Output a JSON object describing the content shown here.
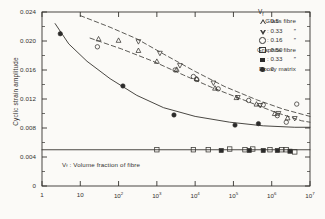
{
  "chart_data": {
    "type": "scatter",
    "title": "",
    "xlabel": "",
    "ylabel": "Cyclic strain amplitude",
    "xscale": "log",
    "xlim": [
      1,
      10000000
    ],
    "ylim": [
      0,
      0.024
    ],
    "grid": false,
    "xticklabels": [
      "1",
      "10",
      "10²",
      "10³",
      "10⁴",
      "10⁵",
      "10⁶",
      "10⁷"
    ],
    "xtickvalues": [
      1,
      10,
      100,
      1000,
      10000,
      100000,
      1000000,
      10000000
    ],
    "yticklabels": [
      "0",
      "0.004",
      "0.008",
      "0.012",
      "0.016",
      "0.020",
      "0.024"
    ],
    "ytickvalues": [
      0,
      0.004,
      0.008,
      0.012,
      0.016,
      0.02,
      0.024
    ],
    "annotation": "Vf : Volume fraction of fibre",
    "legend_position": "top-right",
    "legend_header": "Vf",
    "series": [
      {
        "name": "Glass fibre",
        "vf": "0.5",
        "marker": "triangle-up-open",
        "points": [
          [
            30,
            0.0203
          ],
          [
            100,
            0.0201
          ],
          [
            330,
            0.0187
          ],
          [
            1000,
            0.0172
          ],
          [
            3300,
            0.0161
          ],
          [
            11000,
            0.0148
          ],
          [
            33000,
            0.0135
          ],
          [
            120000,
            0.0122
          ],
          [
            400000,
            0.0113
          ],
          [
            1200000,
            0.01
          ],
          [
            2600000,
            0.0094
          ]
        ]
      },
      {
        "name": "Glass fibre",
        "vf": "0.33",
        "marker": "triangle-down-open",
        "points": [
          [
            330,
            0.0199
          ],
          [
            1200,
            0.0183
          ],
          [
            4000,
            0.0166
          ],
          [
            30000,
            0.0142
          ],
          [
            130000,
            0.0122
          ],
          [
            500000,
            0.0111
          ],
          [
            1500000,
            0.01
          ],
          [
            4000000,
            0.0093
          ]
        ]
      },
      {
        "name": "Glass fibre",
        "vf": "0.16",
        "marker": "circle-open",
        "points": [
          [
            28,
            0.0192
          ],
          [
            3000,
            0.016
          ],
          [
            9000,
            0.0151
          ],
          [
            11000,
            0.0147
          ],
          [
            40000,
            0.0134
          ],
          [
            250000,
            0.0118
          ],
          [
            600000,
            0.0112
          ],
          [
            1400000,
            0.0097
          ],
          [
            2400000,
            0.0088
          ],
          [
            4500000,
            0.0113
          ]
        ]
      },
      {
        "name": "Graphite fibre",
        "vf": "0.50",
        "marker": "square-open",
        "points": [
          [
            1000,
            0.005
          ],
          [
            9000,
            0.005
          ],
          [
            22000,
            0.005
          ],
          [
            80000,
            0.0051
          ],
          [
            200000,
            0.005
          ],
          [
            320000,
            0.0051
          ],
          [
            900000,
            0.005
          ],
          [
            1800000,
            0.005
          ],
          [
            2400000,
            0.005
          ],
          [
            4000000,
            0.0047
          ]
        ]
      },
      {
        "name": "Graphite fibre",
        "vf": "0.33",
        "marker": "square-filled",
        "points": [
          [
            48000,
            0.0049
          ],
          [
            260000,
            0.0049
          ],
          [
            600000,
            0.0049
          ],
          [
            1400000,
            0.0049
          ],
          [
            3000000,
            0.0048
          ]
        ]
      },
      {
        "name": "Epoxy matrix",
        "vf": "0",
        "marker": "circle-filled",
        "points": [
          [
            3,
            0.021
          ],
          [
            130,
            0.0138
          ],
          [
            2800,
            0.0098
          ],
          [
            110000,
            0.0084
          ],
          [
            450000,
            0.0086
          ]
        ]
      }
    ],
    "curves": [
      {
        "name": "epoxy-matrix-curve",
        "style": "solid",
        "points": [
          [
            2.2,
            0.0224
          ],
          [
            5,
            0.0196
          ],
          [
            15,
            0.0172
          ],
          [
            60,
            0.0148
          ],
          [
            300,
            0.0125
          ],
          [
            1500,
            0.0108
          ],
          [
            10000,
            0.0096
          ],
          [
            80000,
            0.0088
          ],
          [
            600000,
            0.0083
          ],
          [
            4000000,
            0.0081
          ],
          [
            10000000,
            0.0081
          ]
        ]
      },
      {
        "name": "glass-fibre-upper-curve",
        "style": "dashed",
        "points": [
          [
            10,
            0.0235
          ],
          [
            60,
            0.0219
          ],
          [
            300,
            0.0203
          ],
          [
            1500,
            0.0182
          ],
          [
            10000,
            0.0158
          ],
          [
            60000,
            0.0137
          ],
          [
            400000,
            0.0119
          ],
          [
            2000000,
            0.0106
          ],
          [
            10000000,
            0.0096
          ]
        ]
      },
      {
        "name": "glass-fibre-lower-curve",
        "style": "dashed",
        "points": [
          [
            18,
            0.0204
          ],
          [
            120,
            0.0189
          ],
          [
            800,
            0.0172
          ],
          [
            5000,
            0.0153
          ],
          [
            30000,
            0.0135
          ],
          [
            200000,
            0.0118
          ],
          [
            1200000,
            0.0102
          ],
          [
            6000000,
            0.009
          ],
          [
            10000000,
            0.0088
          ]
        ]
      },
      {
        "name": "graphite-fibre-curve",
        "style": "solid",
        "points": [
          [
            1,
            0.005
          ],
          [
            10000000,
            0.005
          ]
        ]
      }
    ],
    "legend": [
      {
        "name": "Glass fibre",
        "marker": "triangle-up-open",
        "value": ": 0.5"
      },
      {
        "name": "″",
        "marker": "triangle-down-open",
        "value": ": 0.33"
      },
      {
        "name": "″",
        "marker": "circle-open",
        "value": ": 0.16"
      },
      {
        "name": "Graphite fibre",
        "marker": "square-open",
        "value": ": 0.50"
      },
      {
        "name": "″",
        "marker": "square-filled",
        "value": ": 0.33"
      },
      {
        "name": "Epoxy matrix",
        "marker": "circle-filled",
        "value": ": 0"
      }
    ]
  }
}
